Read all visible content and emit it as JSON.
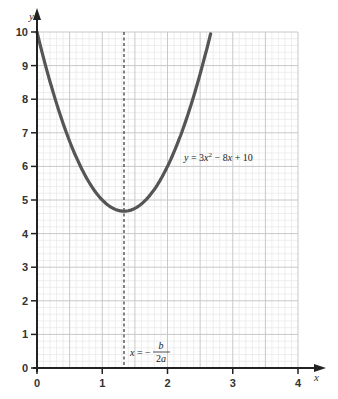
{
  "chart_data": {
    "type": "line",
    "title": "",
    "xlabel": "x",
    "ylabel": "y",
    "xlim": [
      0,
      4
    ],
    "ylim": [
      0,
      10
    ],
    "x_ticks": [
      "0",
      "1",
      "2",
      "3",
      "4"
    ],
    "y_ticks": [
      "0",
      "1",
      "2",
      "3",
      "4",
      "5",
      "6",
      "7",
      "8",
      "9",
      "10"
    ],
    "grid": true,
    "series": [
      {
        "name": "y = 3x^2 - 8x + 10",
        "function": "3x^2 - 8x + 10",
        "x": [
          0,
          0.25,
          0.5,
          0.75,
          1.0,
          1.25,
          1.333,
          1.5,
          1.75,
          2.0,
          2.25,
          2.5,
          2.667
        ],
        "values": [
          10,
          8.1875,
          6.75,
          5.6875,
          5.0,
          4.6875,
          4.667,
          4.75,
          5.1875,
          6.0,
          7.1875,
          8.75,
          10.0
        ]
      }
    ],
    "annotations": [
      {
        "text": "y = 3x² − 8x + 10",
        "x": 2.15,
        "y": 6.7
      },
      {
        "text": "x = −b/2a",
        "type": "vertical-dashed-line",
        "x": 1.333
      }
    ],
    "vertex": {
      "x": 1.333,
      "y": 4.667
    }
  },
  "labels": {
    "x_axis": "x",
    "y_axis": "y",
    "curve_equation_prefix": "y = 3x",
    "curve_equation_exp": "2",
    "curve_equation_suffix": " − 8x + 10",
    "symmetry_prefix": "x = −",
    "symmetry_num": "b",
    "symmetry_den": "2a"
  },
  "colors": {
    "curve": "#555555",
    "axis": "#222222",
    "grid_major": "#c8c8c8",
    "grid_minor": "#e6e6e6"
  }
}
